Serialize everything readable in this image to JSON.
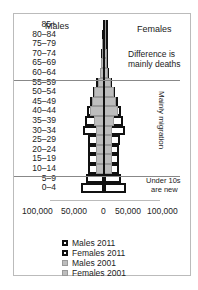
{
  "chart_data": {
    "type": "bar",
    "subtype": "population-pyramid",
    "categories": [
      "85+",
      "80–84",
      "75–79",
      "70–74",
      "65–69",
      "60–64",
      "55–59",
      "50–54",
      "45–49",
      "40–44",
      "35–39",
      "30–34",
      "25–29",
      "20–24",
      "15–19",
      "10–14",
      "5–9",
      "0–4"
    ],
    "series": [
      {
        "name": "Males 2011",
        "values": [
          2000,
          3000,
          4000,
          5000,
          6000,
          8000,
          14000,
          20000,
          26000,
          32000,
          36000,
          38000,
          30000,
          30000,
          30000,
          30000,
          34000,
          42000
        ]
      },
      {
        "name": "Females 2011",
        "values": [
          4000,
          4500,
          5000,
          6000,
          7000,
          9000,
          15000,
          20000,
          26000,
          32000,
          36000,
          38000,
          30000,
          28000,
          28000,
          28000,
          32000,
          40000
        ]
      },
      {
        "name": "Males 2001",
        "values": [
          1000,
          2000,
          3000,
          4000,
          5000,
          7000,
          12000,
          18000,
          22000,
          26000,
          18000,
          14000,
          14000,
          14000,
          14000,
          14000,
          0,
          0
        ]
      },
      {
        "name": "Females 2001",
        "values": [
          3000,
          3500,
          4000,
          5000,
          6000,
          8000,
          13000,
          18000,
          22000,
          26000,
          18000,
          14000,
          14000,
          14000,
          14000,
          14000,
          0,
          0
        ]
      }
    ],
    "xlabel": "",
    "ylabel": "",
    "xlim": [
      -100000,
      100000
    ],
    "x_tick_labels": [
      "100,000",
      "50,000",
      "0",
      "50,000",
      "100,000"
    ],
    "side_labels": {
      "left": "Males",
      "right": "Females"
    },
    "annotations": [
      "Difference is mainly deaths",
      "Mainly migration",
      "Under 10s are new"
    ],
    "legend_position": "bottom",
    "grid": false
  },
  "labels": {
    "males": "Males",
    "females": "Females",
    "deaths": "Difference is\nmainly deaths",
    "deaths1": "Difference is",
    "deaths2": "mainly deaths",
    "migration": "Mainly migration",
    "under1": "Under 10s",
    "under2": "are new"
  },
  "legend": [
    "Males 2011",
    "Females 2011",
    "Males 2001",
    "Females 2001"
  ]
}
